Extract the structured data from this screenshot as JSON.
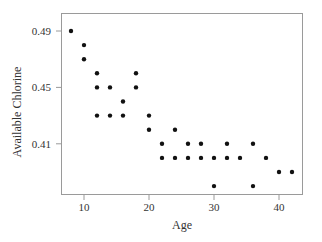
{
  "chart_data": {
    "type": "scatter",
    "title": "",
    "xlabel": "Age",
    "ylabel": "Available Chlorine",
    "xlim": [
      6.5,
      43.5
    ],
    "ylim": [
      0.374,
      0.5
    ],
    "xticks": [
      10,
      20,
      30,
      40
    ],
    "xtick_labels": [
      "10",
      "20",
      "30",
      "40"
    ],
    "yticks": [
      0.41,
      0.45,
      0.49
    ],
    "ytick_labels": [
      "0.41",
      "0.45",
      "0.49"
    ],
    "grid": false,
    "legend": null,
    "marker_color": "#111111",
    "points": [
      {
        "x": 8,
        "y": 0.49
      },
      {
        "x": 10,
        "y": 0.48
      },
      {
        "x": 10,
        "y": 0.47
      },
      {
        "x": 12,
        "y": 0.46
      },
      {
        "x": 12,
        "y": 0.45
      },
      {
        "x": 12,
        "y": 0.43
      },
      {
        "x": 14,
        "y": 0.45
      },
      {
        "x": 14,
        "y": 0.43
      },
      {
        "x": 16,
        "y": 0.44
      },
      {
        "x": 16,
        "y": 0.43
      },
      {
        "x": 18,
        "y": 0.46
      },
      {
        "x": 18,
        "y": 0.45
      },
      {
        "x": 20,
        "y": 0.43
      },
      {
        "x": 20,
        "y": 0.42
      },
      {
        "x": 22,
        "y": 0.41
      },
      {
        "x": 22,
        "y": 0.4
      },
      {
        "x": 24,
        "y": 0.42
      },
      {
        "x": 24,
        "y": 0.4
      },
      {
        "x": 26,
        "y": 0.41
      },
      {
        "x": 26,
        "y": 0.4
      },
      {
        "x": 28,
        "y": 0.41
      },
      {
        "x": 28,
        "y": 0.4
      },
      {
        "x": 30,
        "y": 0.4
      },
      {
        "x": 30,
        "y": 0.38
      },
      {
        "x": 32,
        "y": 0.41
      },
      {
        "x": 32,
        "y": 0.4
      },
      {
        "x": 34,
        "y": 0.4
      },
      {
        "x": 36,
        "y": 0.41
      },
      {
        "x": 36,
        "y": 0.38
      },
      {
        "x": 38,
        "y": 0.4
      },
      {
        "x": 40,
        "y": 0.39
      },
      {
        "x": 42,
        "y": 0.39
      }
    ]
  }
}
